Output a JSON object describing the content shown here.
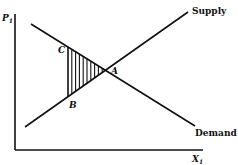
{
  "diagram": {
    "type": "supply-demand",
    "axes": {
      "y_label": "P",
      "y_label_subscript": "1",
      "x_label": "X",
      "x_label_subscript": "1"
    },
    "curves": {
      "supply_label": "Supply",
      "demand_label": "Demand"
    },
    "points": {
      "A": "A",
      "B": "B",
      "C": "C"
    },
    "shaded_region": "triangle ABC (vertical hatching)",
    "colors": {
      "ink": "#111111",
      "background": "#ffffff"
    }
  }
}
